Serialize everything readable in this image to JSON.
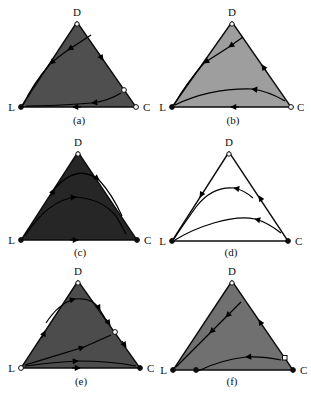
{
  "figure": {
    "background": "#ffffff",
    "line_color": "#000000",
    "vertex_labels": {
      "top": "D",
      "left": "L",
      "right": "C"
    },
    "panels": [
      {
        "id": "a",
        "caption": "(a)",
        "fill": "#4f4f4f"
      },
      {
        "id": "b",
        "caption": "(b)",
        "fill": "#9e9e9e"
      },
      {
        "id": "c",
        "caption": "(c)",
        "fill": "#262626"
      },
      {
        "id": "d",
        "caption": "(d)",
        "fill": "#ffffff"
      },
      {
        "id": "e",
        "caption": "(e)",
        "fill": "#4c4c4c"
      },
      {
        "id": "f",
        "caption": "(f)",
        "fill": "#707070"
      }
    ]
  }
}
